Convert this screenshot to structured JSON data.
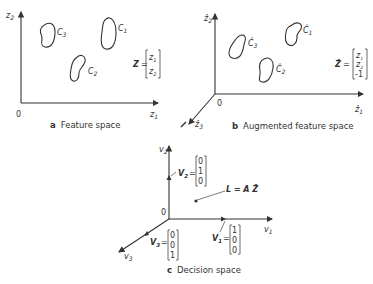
{
  "panels": {
    "a": {
      "caption_letter": "a",
      "caption_text": "Feature space",
      "origin": "0",
      "x_axis": "z",
      "x_sub": "1",
      "y_axis": "z",
      "y_sub": "2",
      "clusters": [
        {
          "label": "C",
          "sub": "1"
        },
        {
          "label": "C",
          "sub": "2"
        },
        {
          "label": "C",
          "sub": "3"
        }
      ],
      "vector": {
        "name": "Z",
        "eq": "=",
        "entries": [
          "z1",
          "z2"
        ]
      }
    },
    "b": {
      "caption_letter": "b",
      "caption_text": "Augmented feature space",
      "origin": "0",
      "x_axis": "ẑ",
      "x_sub": "1",
      "y_axis": "ẑ",
      "y_sub": "2",
      "z_axis": "ẑ",
      "z_sub": "3",
      "clusters": [
        {
          "label": "Ĉ",
          "sub": "1"
        },
        {
          "label": "Ĉ",
          "sub": "2"
        },
        {
          "label": "Ĉ",
          "sub": "3"
        }
      ],
      "vector": {
        "name": "Ẑ",
        "eq": "=",
        "entries": [
          "z1",
          "z2",
          "-1"
        ]
      }
    },
    "c": {
      "caption_letter": "c",
      "caption_text": "Decision space",
      "origin": "0",
      "x_axis": "v",
      "x_sub": "1",
      "y_axis": "v",
      "y_sub": "2",
      "z_axis": "v",
      "z_sub": "3",
      "v1": {
        "name": "V",
        "sub": "1",
        "eq": "=",
        "entries": [
          "1",
          "0",
          "0"
        ]
      },
      "v2": {
        "name": "V",
        "sub": "2",
        "eq": "=",
        "entries": [
          "0",
          "1",
          "0"
        ]
      },
      "v3": {
        "name": "V",
        "sub": "3",
        "eq": "=",
        "entries": [
          "0",
          "0",
          "1"
        ]
      },
      "point_label": "L = A Ẑ"
    }
  }
}
